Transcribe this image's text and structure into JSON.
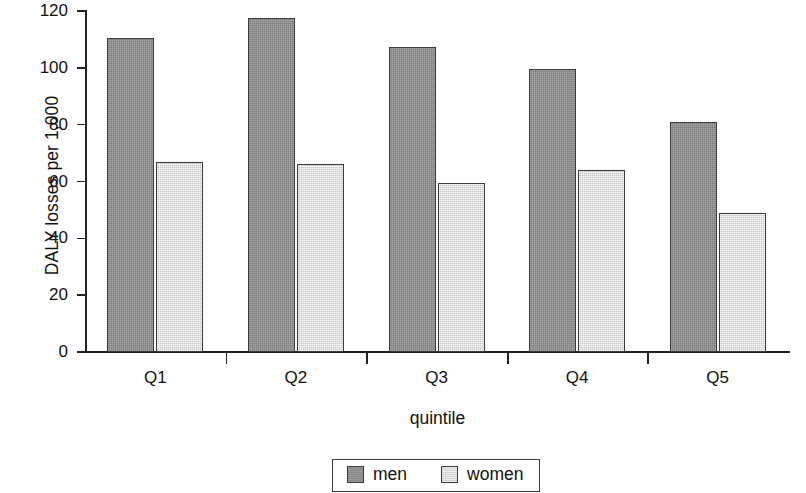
{
  "chart_data": {
    "type": "bar",
    "title": "",
    "subtitle": "",
    "xlabel": "quintile",
    "ylabel": "DALY losses per 1,000",
    "categories": [
      "Q1",
      "Q2",
      "Q3",
      "Q4",
      "Q5"
    ],
    "series": [
      {
        "name": "men",
        "color": "#8d8d8d",
        "values": [
          110.5,
          117.5,
          107.5,
          99.5,
          81.0
        ]
      },
      {
        "name": "women",
        "color": "#dddddd",
        "values": [
          67.0,
          66.0,
          59.5,
          64.0,
          49.0
        ]
      }
    ],
    "ylim": [
      0,
      120
    ],
    "yticks": [
      0,
      20,
      40,
      60,
      80,
      100,
      120
    ],
    "ytick_labels": [
      "0",
      "20",
      "40",
      "60",
      "80",
      "100",
      "120"
    ],
    "grid": false,
    "legend": {
      "position": "bottom-center",
      "entries": [
        {
          "label": "men",
          "color": "#8d8d8d"
        },
        {
          "label": "women",
          "color": "#dddddd"
        }
      ]
    }
  },
  "axes": {
    "y_title": "DALY losses per 1,000",
    "x_title": "quintile"
  }
}
